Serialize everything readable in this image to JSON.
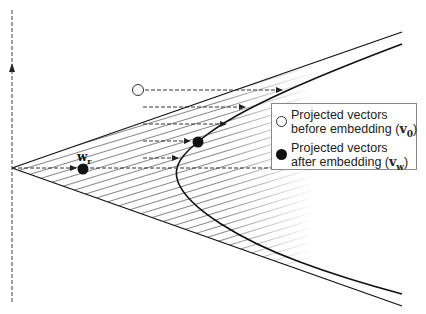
{
  "figure": {
    "type": "geometric diagram",
    "colors": {
      "line": "#111111",
      "hatch": "#555555",
      "dashed": "#444444",
      "legend_border": "#888888",
      "background": "#ffffff"
    }
  },
  "labels": {
    "point_label_main": "w",
    "point_label_sub": "r"
  },
  "legend": {
    "items": [
      {
        "marker": "open-circle",
        "line1": "Projected vectors",
        "line2_prefix": "before embedding (",
        "symbol": "v",
        "subscript": "0",
        "line2_suffix": ")"
      },
      {
        "marker": "filled-circle",
        "line1": "Projected vectors",
        "line2_prefix": "after embedding (",
        "symbol": "v",
        "subscript": "w",
        "line2_suffix": ")"
      }
    ]
  },
  "geometry": {
    "axis": {
      "x": 12,
      "y_top": 8,
      "y_bottom": 302,
      "arrow_y": 70
    },
    "apex": [
      12,
      168
    ],
    "cone_upper_end": [
      402,
      32
    ],
    "cone_lower_end": [
      402,
      306
    ],
    "hyperbola": {
      "top_end": [
        402,
        44
      ],
      "vertex": [
        176,
        168
      ],
      "bottom_end": [
        402,
        294
      ]
    },
    "open_point": [
      138,
      90
    ],
    "after_point": [
      198,
      142
    ],
    "wr_point": [
      83,
      169
    ],
    "dashed_arrows": [
      {
        "y": 90,
        "x_start": 145,
        "x_end": 282
      },
      {
        "y": 107,
        "x_start": 143,
        "x_end": 245
      },
      {
        "y": 124,
        "x_start": 143,
        "x_end": 226
      },
      {
        "y": 141,
        "x_start": 143,
        "x_end": 190
      },
      {
        "y": 158,
        "x_start": 143,
        "x_end": 178
      },
      {
        "y": 168,
        "x_start": 12,
        "x_end": 76
      }
    ]
  }
}
